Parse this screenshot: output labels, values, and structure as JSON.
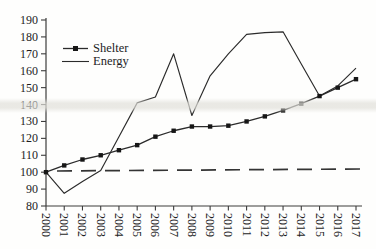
{
  "figure": {
    "background_color": "#fefefd",
    "line_color": "#2b2b2b",
    "axis_color": "#3c3c3c",
    "text_color": "#1d1d1d"
  },
  "chart_data": {
    "type": "line",
    "title": "",
    "xlabel": "",
    "ylabel": "",
    "x": [
      2000,
      2001,
      2002,
      2003,
      2004,
      2005,
      2006,
      2007,
      2008,
      2009,
      2010,
      2011,
      2012,
      2013,
      2014,
      2015,
      2016,
      2017
    ],
    "series": [
      {
        "name": "Shelter",
        "marker": "square",
        "values": [
          100,
          104,
          107.5,
          110,
          113,
          116,
          121,
          124.5,
          127,
          127,
          127.5,
          130,
          133,
          136.5,
          140.5,
          145,
          150,
          155
        ]
      },
      {
        "name": "Energy",
        "marker": "none",
        "values": [
          100,
          87.5,
          94.5,
          101,
          121,
          141,
          144.5,
          170,
          133.5,
          157,
          170,
          181.5,
          182.5,
          183,
          164,
          145,
          151,
          161.5
        ]
      }
    ],
    "reference_line": {
      "value": 100,
      "style": "dashed"
    },
    "ylim": [
      80,
      190
    ],
    "yticks": [
      80,
      90,
      100,
      110,
      120,
      130,
      140,
      150,
      160,
      170,
      180,
      190
    ],
    "grid": false,
    "legend_position": "upper-left-inside",
    "x_tick_label_rotation_deg": 90
  }
}
